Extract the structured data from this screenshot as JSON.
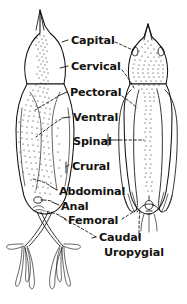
{
  "figure": {
    "background_color": "#ffffff",
    "ink_color": "#14120e",
    "width": 187,
    "height": 304,
    "views": [
      {
        "id": "ventral",
        "name": "Ventral view",
        "side": "left"
      },
      {
        "id": "dorsal",
        "name": "Dorsal view",
        "side": "right"
      }
    ]
  },
  "labels": [
    {
      "id": "capital",
      "text": "Capital",
      "x": 71,
      "y": 44,
      "anchor": "start"
    },
    {
      "id": "cervical",
      "text": "Cervical",
      "x": 71,
      "y": 70,
      "anchor": "start"
    },
    {
      "id": "pectoral",
      "text": "Pectoral",
      "x": 70,
      "y": 96,
      "anchor": "start"
    },
    {
      "id": "ventral",
      "text": "Ventral",
      "x": 73,
      "y": 121,
      "anchor": "start"
    },
    {
      "id": "spinal",
      "text": "Spinal",
      "x": 73,
      "y": 143,
      "anchor": "start"
    },
    {
      "id": "crural",
      "text": "Crural",
      "x": 72,
      "y": 169,
      "anchor": "start"
    },
    {
      "id": "abdominal",
      "text": "Abdominal",
      "x": 59,
      "y": 194,
      "anchor": "start"
    },
    {
      "id": "anal",
      "text": "Anal",
      "x": 61,
      "y": 209,
      "anchor": "start"
    },
    {
      "id": "femoral",
      "text": "Femoral",
      "x": 68,
      "y": 223,
      "anchor": "start"
    },
    {
      "id": "caudal",
      "text": "Caudal",
      "x": 99,
      "y": 240,
      "anchor": "start"
    },
    {
      "id": "uropygial",
      "text": "Uropygial",
      "x": 104,
      "y": 255,
      "anchor": "start"
    }
  ]
}
